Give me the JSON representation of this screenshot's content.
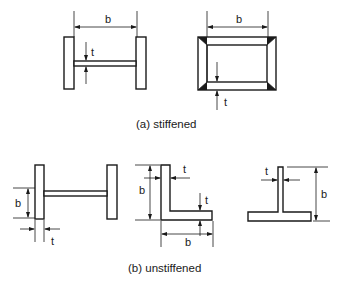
{
  "figure": {
    "type": "engineering-diagram",
    "dimension_labels": {
      "width": "b",
      "thickness": "t"
    },
    "groups": [
      {
        "id": "a",
        "caption": "(a) stiffened",
        "sections": [
          {
            "name": "I-section (web)",
            "labels": [
              "b",
              "t"
            ]
          },
          {
            "name": "box section (flange)",
            "labels": [
              "b",
              "t"
            ]
          }
        ]
      },
      {
        "id": "b",
        "caption": "(b) unstiffened",
        "sections": [
          {
            "name": "I-section (flange outstand)",
            "labels": [
              "b",
              "t"
            ]
          },
          {
            "name": "angle section",
            "labels": [
              "b",
              "t",
              "t",
              "b"
            ]
          },
          {
            "name": "tee section (stem)",
            "labels": [
              "t",
              "b"
            ]
          }
        ]
      }
    ]
  },
  "colors": {
    "line": "#1a1a1a",
    "background": "#ffffff"
  }
}
